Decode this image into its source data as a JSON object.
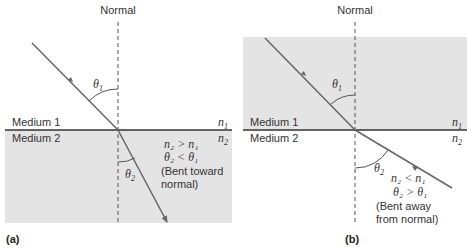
{
  "panel_a": {
    "label": "(a)",
    "normal_label": "Normal",
    "medium1": "Medium 1",
    "medium2": "Medium 2",
    "n1": "n",
    "n1_sub": "1",
    "n2": "n",
    "n2_sub": "2",
    "theta1": "θ",
    "theta1_sub": "1",
    "theta2": "θ",
    "theta2_sub": "2",
    "relation1": "n₂ > n₁",
    "relation2": "θ₂ < θ₁",
    "note_line1": "(Bent toward",
    "note_line2": "normal)"
  },
  "panel_b": {
    "label": "(b)",
    "normal_label": "Normal",
    "medium1": "Medium 1",
    "medium2": "Medium 2",
    "n1": "n",
    "n1_sub": "1",
    "n2": "n",
    "n2_sub": "2",
    "theta1": "θ",
    "theta1_sub": "1",
    "theta2": "θ",
    "theta2_sub": "2",
    "relation1": "n₂ < n₁",
    "relation2": "θ₂ > θ₁",
    "note_line1": "(Bent away",
    "note_line2": "from normal)"
  },
  "colors": {
    "medium_fill": "#e4e4e4",
    "ray": "#666666",
    "interface": "#333333",
    "normal": "#555555"
  }
}
